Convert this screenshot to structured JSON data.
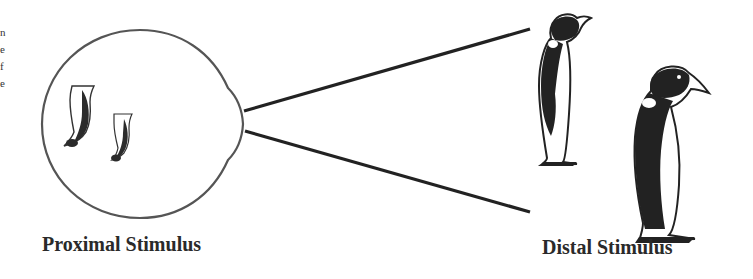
{
  "diagram": {
    "labels": {
      "proximal": "Proximal Stimulus",
      "distal": "Distal Stimulus"
    },
    "edge_fragments": [
      "n",
      "e",
      "f",
      "e"
    ],
    "elements": {
      "eye": "eyeball outline with retinal image of two inverted penguins",
      "projection_lines": 2,
      "distal_objects": [
        "near penguin (small)",
        "far penguin (large)"
      ]
    },
    "colors": {
      "ink": "#222222",
      "outline": "#555555",
      "background": "#ffffff"
    }
  }
}
